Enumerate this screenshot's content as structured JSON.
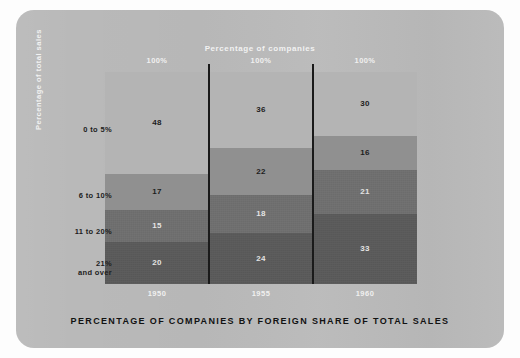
{
  "figure": {
    "top_title": "Percentage of companies",
    "y_axis_title": "Percentage of  total sales",
    "caption": "PERCENTAGE OF COMPANIES BY FOREIGN SHARE OF TOTAL SALES"
  },
  "colors": {
    "panel_background": "#b9b9b9",
    "page_background": "#fdfdfd",
    "band_0_to_5": "#b4b4b4",
    "band_6_to_10": "#909090",
    "band_11_to_20": "#6f6f6f",
    "band_21_and_over": "#5a5a5a",
    "divider_line": "#1a1a1a",
    "light_text": "#f0f0f0",
    "dark_text": "#1d1d1d"
  },
  "chart_data": {
    "type": "bar",
    "title": "PERCENTAGE OF COMPANIES BY FOREIGN SHARE OF TOTAL SALES",
    "subtitle": "Percentage of companies",
    "xlabel": "",
    "ylabel": "Percentage of  total sales",
    "ylim": [
      0,
      100
    ],
    "grid": false,
    "legend_position": "left-axis-labels",
    "stacked": true,
    "stack_normalized_total": 100,
    "categories": [
      "1950",
      "1955",
      "1960"
    ],
    "column_totals": [
      "100%",
      "100%",
      "100%"
    ],
    "series": [
      {
        "name": "0 to 5%",
        "values": [
          48,
          17,
          15
        ]
      },
      {
        "name": "6 to 10%",
        "values": [
          17,
          22,
          16
        ]
      },
      {
        "name": "11 to 20%",
        "values": [
          15,
          18,
          21
        ]
      },
      {
        "name": "21% and over",
        "values": [
          20,
          24,
          33
        ]
      }
    ],
    "columns": [
      {
        "category": "1950",
        "total_label": "100%",
        "segments": [
          {
            "band": "0 to 5%",
            "value": 48,
            "label": "48"
          },
          {
            "band": "6 to 10%",
            "value": 17,
            "label": "17"
          },
          {
            "band": "11 to 20%",
            "value": 15,
            "label": "15"
          },
          {
            "band": "21% and over",
            "value": 20,
            "label": "20"
          }
        ]
      },
      {
        "category": "1955",
        "total_label": "100%",
        "segments": [
          {
            "band": "0 to 5%",
            "value": 36,
            "label": "36"
          },
          {
            "band": "6 to 10%",
            "value": 22,
            "label": "22"
          },
          {
            "band": "11 to 20%",
            "value": 18,
            "label": "18"
          },
          {
            "band": "21% and over",
            "value": 24,
            "label": "24"
          }
        ]
      },
      {
        "category": "1960",
        "total_label": "100%",
        "segments": [
          {
            "band": "0 to 5%",
            "value": 30,
            "label": "30"
          },
          {
            "band": "6 to 10%",
            "value": 16,
            "label": "16"
          },
          {
            "band": "11 to 20%",
            "value": 21,
            "label": "21"
          },
          {
            "band": "21% and over",
            "value": 33,
            "label": "33"
          }
        ]
      }
    ],
    "band_labels": [
      "0 to 5%",
      "6 to 10%",
      "11 to 20%",
      "21%\nand over"
    ],
    "band_labels_display": [
      {
        "line1": "0 to 5%",
        "line2": ""
      },
      {
        "line1": "6 to 10%",
        "line2": ""
      },
      {
        "line1": "11 to 20%",
        "line2": ""
      },
      {
        "line1": "21%",
        "line2": "and over"
      }
    ]
  }
}
